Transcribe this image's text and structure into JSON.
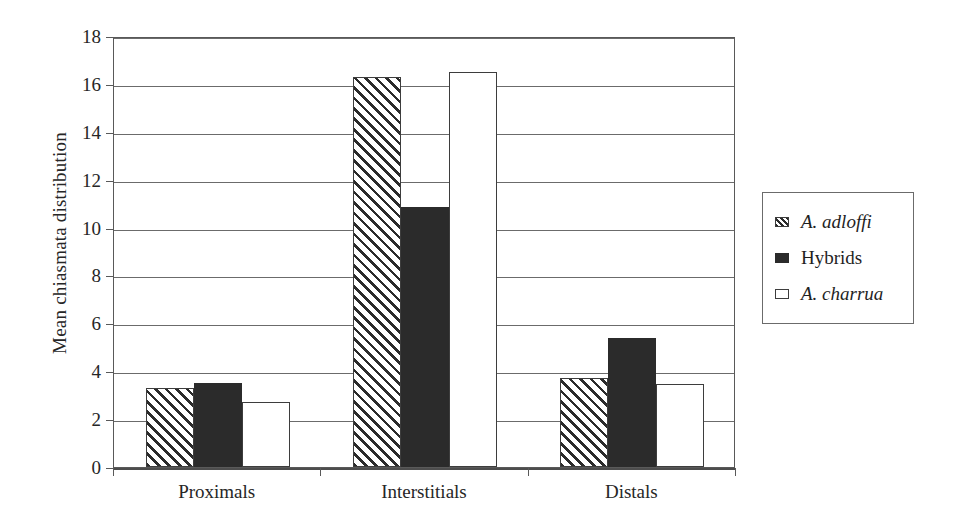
{
  "chart_data": {
    "type": "bar",
    "title": "",
    "subtitle": "",
    "xlabel": "",
    "ylabel": "Mean chiasmata distribution",
    "categories": [
      "Proximals",
      "Interstitials",
      "Distals"
    ],
    "series": [
      {
        "name": "A. adloffi",
        "style": "hatched",
        "italic": true,
        "values": [
          3.3,
          16.3,
          3.7
        ]
      },
      {
        "name": "Hybrids",
        "style": "solid",
        "italic": false,
        "values": [
          3.5,
          10.85,
          5.4
        ]
      },
      {
        "name": "A. charrua",
        "style": "open",
        "italic": true,
        "values": [
          2.7,
          16.5,
          3.45
        ]
      }
    ],
    "ylim": [
      0,
      18
    ],
    "ytick_step": 2,
    "yticks": [
      0,
      2,
      4,
      6,
      8,
      10,
      12,
      14,
      16,
      18
    ],
    "ytick_labels": [
      "0",
      "2",
      "4",
      "6",
      "8",
      "10",
      "12",
      "14",
      "16",
      "18"
    ],
    "grid": true,
    "grid_axis": "y",
    "legend_position": "right",
    "colors": {
      "axis": "#595959",
      "gridline": "#6b6b6b",
      "bar_outline": "#3d3d3d",
      "solid_fill": "#2b2b2b",
      "open_fill": "#ffffff",
      "background": "#ffffff",
      "text": "#262626"
    }
  },
  "legend": {
    "items": [
      {
        "label": "A. adloffi",
        "swatch": "hatched-swatch-icon"
      },
      {
        "label": "Hybrids",
        "swatch": "solid-swatch-icon"
      },
      {
        "label": "A. charrua",
        "swatch": "open-swatch-icon"
      }
    ]
  }
}
